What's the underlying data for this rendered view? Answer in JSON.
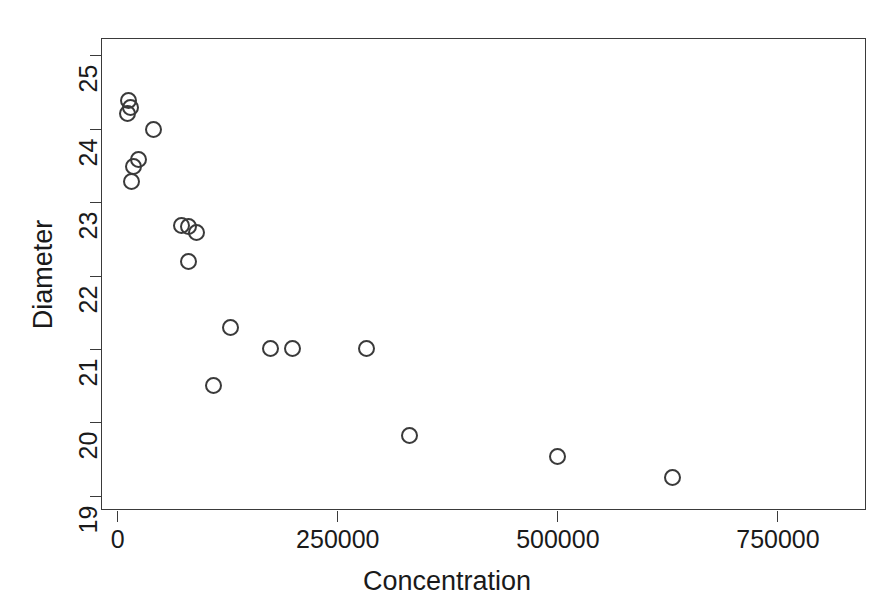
{
  "chart_data": {
    "type": "scatter",
    "title": "",
    "xlabel": "Concentration",
    "ylabel": "Diameter",
    "xlim": [
      -19000,
      850000
    ],
    "ylim": [
      18.82,
      25.25
    ],
    "grid": false,
    "legend": null,
    "marker": "open-circle",
    "xticks": [
      0,
      250000,
      500000,
      750000
    ],
    "xticklabels": [
      "0",
      "250000",
      "500000",
      "750000"
    ],
    "yticks": [
      19,
      20,
      21,
      22,
      23,
      24,
      25
    ],
    "yticklabels": [
      "19",
      "20",
      "21",
      "22",
      "23",
      "24",
      "25"
    ],
    "points": [
      {
        "x": 12000,
        "y": 24.4
      },
      {
        "x": 14000,
        "y": 24.3
      },
      {
        "x": 11000,
        "y": 24.22
      },
      {
        "x": 41000,
        "y": 24.0
      },
      {
        "x": 24000,
        "y": 23.6
      },
      {
        "x": 18000,
        "y": 23.5
      },
      {
        "x": 16000,
        "y": 23.3
      },
      {
        "x": 72000,
        "y": 22.7
      },
      {
        "x": 80000,
        "y": 22.68
      },
      {
        "x": 90000,
        "y": 22.6
      },
      {
        "x": 80000,
        "y": 22.2
      },
      {
        "x": 128000,
        "y": 21.3
      },
      {
        "x": 173000,
        "y": 21.02
      },
      {
        "x": 198000,
        "y": 21.02
      },
      {
        "x": 283000,
        "y": 21.02
      },
      {
        "x": 109000,
        "y": 20.52
      },
      {
        "x": 332000,
        "y": 19.84
      },
      {
        "x": 500000,
        "y": 19.55
      },
      {
        "x": 630000,
        "y": 19.26
      }
    ]
  },
  "axis": {
    "y_title": "Diameter",
    "x_title": "Concentration"
  }
}
